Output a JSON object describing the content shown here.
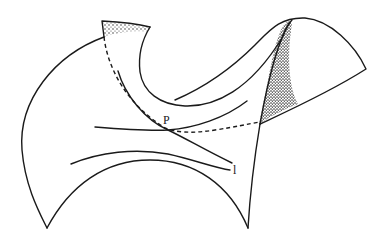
{
  "figure": {
    "labels": {
      "point": "P",
      "line": "l"
    },
    "colors": {
      "stroke": "#1a1a1a",
      "background": "#ffffff",
      "stipple": "#222222"
    }
  }
}
